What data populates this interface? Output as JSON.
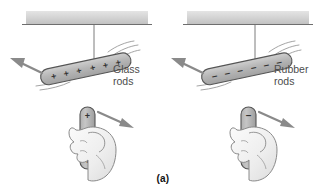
{
  "figure": {
    "caption": "(a)",
    "background_color": "#ffffff",
    "ceiling_color": "#d4d4d4",
    "ceiling_edge_color": "#6e6e6e",
    "rod_fill_color": "#b7b7b7",
    "rod_outline_color": "#555555",
    "arrow_color": "#808080",
    "hand_fill_color": "#efefef",
    "hand_outline_color": "#8a8a8a",
    "string_color": "#6e6e6e",
    "motion_line_color": "#9a9a9a",
    "charge_symbol_color": "#333333"
  },
  "panels": [
    {
      "id": "glass-panel",
      "label": "Glass\nrods",
      "material": "Glass",
      "charge_sign": "+",
      "hanging_rod": {
        "charge_symbol": "+",
        "charge_count": 6,
        "charges": [
          "+",
          "+",
          "+",
          "+",
          "+",
          "+"
        ],
        "repulsion_direction": "up-left"
      },
      "held_rod": {
        "charge_symbol": "+",
        "charge_count": 3,
        "charges": [
          "+",
          "+",
          "+"
        ],
        "force_direction": "right-down"
      }
    },
    {
      "id": "rubber-panel",
      "label": "Rubber\nrods",
      "material": "Rubber",
      "charge_sign": "−",
      "hanging_rod": {
        "charge_symbol": "−",
        "charge_count": 6,
        "charges": [
          "−",
          "−",
          "−",
          "−",
          "−",
          "−"
        ],
        "repulsion_direction": "up-left"
      },
      "held_rod": {
        "charge_symbol": "−",
        "charge_count": 3,
        "charges": [
          "−",
          "−",
          "−"
        ],
        "force_direction": "right-down"
      }
    }
  ]
}
